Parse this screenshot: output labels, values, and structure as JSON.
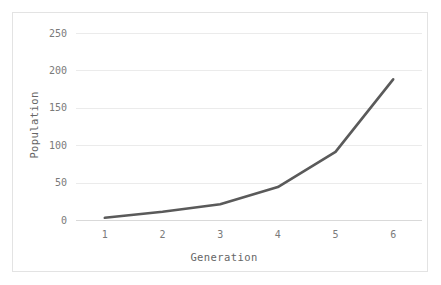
{
  "chart_data": {
    "type": "line",
    "title": "",
    "xlabel": "Generation",
    "ylabel": "Population",
    "x": [
      1,
      2,
      3,
      4,
      5,
      6
    ],
    "categories": [
      "1",
      "2",
      "3",
      "4",
      "5",
      "6"
    ],
    "values": [
      3,
      11,
      21,
      44,
      91,
      188
    ],
    "series": [
      {
        "name": "Population",
        "values": [
          3,
          11,
          21,
          44,
          91,
          188
        ]
      }
    ],
    "xlim": [
      0.5,
      6.5
    ],
    "ylim": [
      0,
      250
    ],
    "ytick_labels": [
      "0",
      "50",
      "100",
      "150",
      "200",
      "250"
    ],
    "ytick_values": [
      0,
      50,
      100,
      150,
      200,
      250
    ],
    "xtick_labels": [
      "1",
      "2",
      "3",
      "4",
      "5",
      "6"
    ],
    "grid": "horizontal",
    "legend": "none",
    "line_color": "#5a5a5a",
    "grid_color": "#ebebeb",
    "axis_color": "#d9d9d9",
    "tick_text_color": "#7a7a7a",
    "axis_title_color": "#666666",
    "background_color": "#ffffff",
    "border_color": "#e3e3e3"
  }
}
